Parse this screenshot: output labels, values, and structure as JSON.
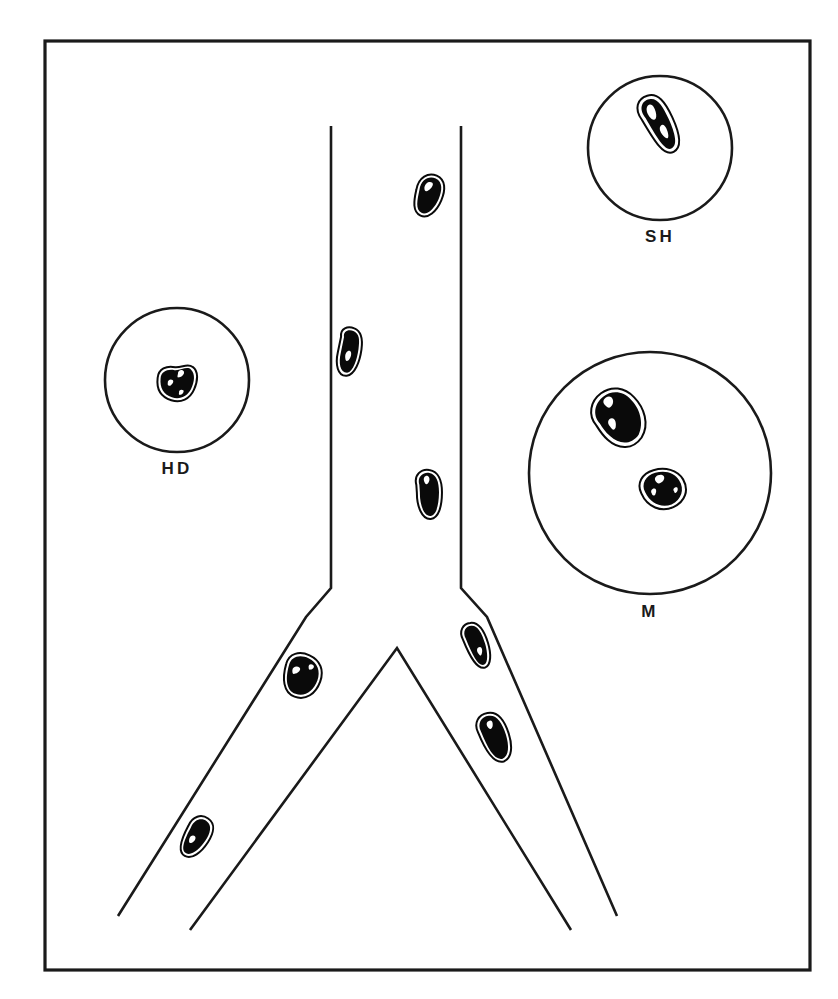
{
  "figure": {
    "background_color": "#ffffff",
    "ink_color": "#1a1a1a",
    "particle_fill": "#0a0a0a",
    "width": 838,
    "height": 999
  },
  "frame": {
    "name": "figure-border",
    "x": 45,
    "y": 41,
    "width": 765,
    "height": 929
  },
  "insets": [
    {
      "id": "sh",
      "label": "SH",
      "cx": 660,
      "cy": 148,
      "r": 72,
      "label_x": 660,
      "label_y": 242,
      "particle_count": 1
    },
    {
      "id": "hd",
      "label": "HD",
      "cx": 177,
      "cy": 380,
      "r": 72,
      "label_x": 177,
      "label_y": 474,
      "particle_count": 1
    },
    {
      "id": "m",
      "label": "M",
      "cx": 650,
      "cy": 473,
      "r": 121,
      "label_x": 650,
      "label_y": 617,
      "particle_count": 2
    }
  ],
  "tube": {
    "trunk_left_x": 331,
    "trunk_right_x": 461,
    "trunk_top_y": 126,
    "shoulder_y": 588,
    "crotch_apex_x": 397,
    "crotch_apex_y": 648,
    "left_branch_end_x": 118,
    "left_branch_end_y": 916,
    "right_branch_end_x": 617,
    "right_branch_end_y": 916
  },
  "particles": [
    {
      "id": "p1",
      "location": "trunk-upper-right",
      "cx": 428,
      "cy": 196,
      "rx": 13,
      "ry": 21,
      "rotation": 18
    },
    {
      "id": "p2",
      "location": "trunk-left-wall",
      "cx": 350,
      "cy": 352,
      "rx": 12,
      "ry": 24,
      "rotation": 8
    },
    {
      "id": "p3",
      "location": "trunk-mid-right",
      "cx": 429,
      "cy": 494,
      "rx": 13,
      "ry": 25,
      "rotation": -4
    },
    {
      "id": "p4",
      "location": "left-branch-upper",
      "cx": 302,
      "cy": 676,
      "rx": 19,
      "ry": 22,
      "rotation": 20
    },
    {
      "id": "p5",
      "location": "left-branch-lower",
      "cx": 196,
      "cy": 837,
      "rx": 12,
      "ry": 22,
      "rotation": 28
    },
    {
      "id": "p6",
      "location": "right-branch-upper",
      "cx": 477,
      "cy": 645,
      "rx": 11,
      "ry": 23,
      "rotation": -22
    },
    {
      "id": "p7",
      "location": "right-branch-lower",
      "cx": 495,
      "cy": 737,
      "rx": 14,
      "ry": 25,
      "rotation": -22
    },
    {
      "id": "sh1",
      "location": "inset-sh",
      "cx": 660,
      "cy": 124,
      "rx": 14,
      "ry": 30,
      "rotation": -28
    },
    {
      "id": "hd1",
      "location": "inset-hd",
      "cx": 177,
      "cy": 383,
      "rx": 20,
      "ry": 18,
      "rotation": 12
    },
    {
      "id": "m1",
      "location": "inset-m",
      "cx": 620,
      "cy": 418,
      "rx": 24,
      "ry": 32,
      "rotation": -32
    },
    {
      "id": "m2",
      "location": "inset-m",
      "cx": 664,
      "cy": 489,
      "rx": 23,
      "ry": 20,
      "rotation": -16
    }
  ]
}
